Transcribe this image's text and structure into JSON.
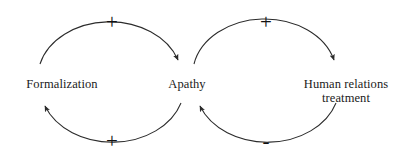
{
  "diagram": {
    "type": "causal-loop-diagram",
    "background_color": "#ffffff",
    "stroke_color": "#2b2b2b",
    "text_color": "#1a1a1a",
    "nodes": [
      {
        "id": "formalization",
        "label": "Formalization",
        "label_line2": ""
      },
      {
        "id": "apathy",
        "label": "Apathy",
        "label_line2": ""
      },
      {
        "id": "human_relations",
        "label": "Human relations",
        "label_line2": "treatment"
      }
    ],
    "links": [
      {
        "id": "formalization-to-apathy",
        "from": "Formalization",
        "to": "Apathy",
        "polarity": "+",
        "position": "top-left-arc"
      },
      {
        "id": "apathy-to-formalization",
        "from": "Apathy",
        "to": "Formalization",
        "polarity": "+",
        "position": "bottom-left-arc"
      },
      {
        "id": "apathy-to-human-relations",
        "from": "Apathy",
        "to": "Human relations treatment",
        "polarity": "+",
        "position": "top-right-arc"
      },
      {
        "id": "human-relations-to-apathy",
        "from": "Human relations treatment",
        "to": "Apathy",
        "polarity": "-",
        "position": "bottom-right-arc"
      }
    ],
    "polarity_markers": {
      "left_top": "+",
      "left_bottom": "+",
      "right_top": "+",
      "right_bottom": "-"
    }
  }
}
